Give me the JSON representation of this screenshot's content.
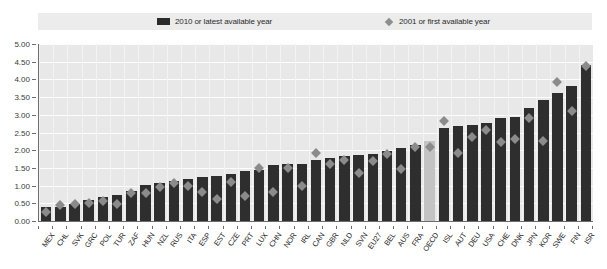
{
  "figure": {
    "title_fragment": "",
    "bar_color": "#2e2e2e",
    "marker_color": "#8b8b8b",
    "highlight_color": "#c3c3c3",
    "legend_band_color": "#ececed",
    "plot_background": "#e8e8e9"
  },
  "legend": {
    "items": [
      {
        "label": "2010 or latest available year",
        "marker": "bar-swatch",
        "color": "#2e2e2e"
      },
      {
        "label": "2001 or first available year",
        "marker": "diamond-swatch",
        "color": "#8b8b8b"
      }
    ]
  },
  "chart_data": {
    "type": "bar",
    "title": "",
    "subtitle": "",
    "xlabel": "",
    "ylabel": "",
    "ylim": [
      0.0,
      5.0
    ],
    "ytick_labels": [
      "0.00",
      "0.50",
      "1.00",
      "1.50",
      "2.00",
      "2.50",
      "3.00",
      "3.50",
      "4.00",
      "4.50",
      "5.00"
    ],
    "ytick_values": [
      0.0,
      0.5,
      1.0,
      1.5,
      2.0,
      2.5,
      3.0,
      3.5,
      4.0,
      4.5,
      5.0
    ],
    "grid": true,
    "legend_position": "top",
    "highlight_category": "OECD",
    "categories": [
      "MEX",
      "CHL",
      "SVK",
      "GRC",
      "POL",
      "TUR",
      "ZAF",
      "HUN",
      "NZL",
      "RUS",
      "ITA",
      "ESP",
      "EST",
      "CZE",
      "PRT",
      "LUX",
      "CHN",
      "NOR",
      "IRL",
      "CAN",
      "GBR",
      "NLD",
      "SVN",
      "EU27",
      "BEL",
      "AUS",
      "FRA",
      "OECD",
      "ISL",
      "AUT",
      "DEU",
      "USA",
      "CHE",
      "DNK",
      "JPN",
      "KOR",
      "SWE",
      "FIN",
      "ISR"
    ],
    "series": [
      {
        "name": "2010 or latest available year",
        "values": [
          0.4,
          0.4,
          0.49,
          0.58,
          0.68,
          0.73,
          0.85,
          1.02,
          1.08,
          1.13,
          1.18,
          1.25,
          1.28,
          1.33,
          1.4,
          1.45,
          1.58,
          1.6,
          1.62,
          1.72,
          1.78,
          1.83,
          1.86,
          1.9,
          1.98,
          2.05,
          2.15,
          2.25,
          2.62,
          2.68,
          2.72,
          2.78,
          2.92,
          2.95,
          3.18,
          3.42,
          3.62,
          3.82,
          4.42
        ]
      },
      {
        "name": "2001 or first available year",
        "values": [
          0.36,
          0.55,
          0.58,
          0.6,
          0.66,
          0.58,
          0.88,
          0.9,
          1.06,
          1.18,
          1.08,
          0.92,
          0.72,
          1.2,
          0.8,
          1.6,
          0.92,
          1.6,
          1.08,
          2.02,
          1.72,
          1.82,
          1.46,
          1.8,
          1.98,
          1.56,
          2.18,
          2.18,
          2.92,
          2.02,
          2.46,
          2.68,
          2.32,
          2.42,
          3.02,
          2.36,
          4.02,
          3.22,
          4.48
        ]
      }
    ]
  }
}
